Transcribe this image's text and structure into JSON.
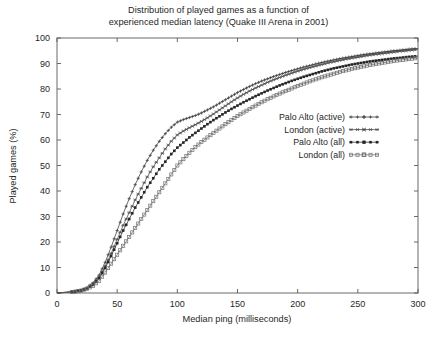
{
  "chart_data": {
    "type": "line",
    "title": "Distribution of played games as a function of experienced median latency (Quake III Arena in 2001)",
    "title_line1": "Distribution of played games as a function of",
    "title_line2": "experienced median latency (Quake III Arena in 2001)",
    "xlabel": "Median ping (milliseconds)",
    "ylabel": "Played games (%)",
    "xlim": [
      0,
      300
    ],
    "ylim": [
      0,
      100
    ],
    "xticks": [
      0,
      50,
      100,
      150,
      200,
      250,
      300
    ],
    "yticks": [
      0,
      10,
      20,
      30,
      40,
      50,
      60,
      70,
      80,
      90,
      100
    ],
    "xtick_labels": [
      "0",
      "50",
      "100",
      "150",
      "200",
      "250",
      "300"
    ],
    "ytick_labels": [
      "0",
      "10",
      "20",
      "30",
      "40",
      "50",
      "60",
      "70",
      "80",
      "90",
      "100"
    ],
    "grid": false,
    "legend_position": "center-right",
    "legend_entries": [
      {
        "label": "Palo Alto (active)",
        "marker": "plus-marker",
        "color": "#3b3b3b"
      },
      {
        "label": "London (active)",
        "marker": "cross-marker",
        "color": "#4a4a4a"
      },
      {
        "label": "Palo Alto (all)",
        "marker": "filled-square-marker",
        "color": "#262626"
      },
      {
        "label": "London (all)",
        "marker": "open-square-marker",
        "color": "#6e6e6e"
      }
    ],
    "x": [
      0,
      5,
      10,
      15,
      20,
      25,
      30,
      35,
      40,
      45,
      50,
      55,
      60,
      65,
      70,
      75,
      80,
      85,
      90,
      95,
      100,
      105,
      110,
      115,
      120,
      125,
      130,
      135,
      140,
      145,
      150,
      155,
      160,
      165,
      170,
      175,
      180,
      185,
      190,
      195,
      200,
      205,
      210,
      215,
      220,
      225,
      230,
      235,
      240,
      245,
      250,
      255,
      260,
      265,
      270,
      275,
      280,
      285,
      290,
      295,
      300
    ],
    "series": [
      {
        "name": "Palo Alto (active)",
        "marker": "plus-marker",
        "color": "#3b3b3b",
        "values": [
          0,
          0.2,
          0.4,
          0.7,
          1.2,
          2.2,
          4.0,
          7.0,
          12.0,
          18.0,
          24.5,
          31.0,
          37.0,
          42.5,
          47.5,
          52.0,
          56.0,
          59.5,
          62.5,
          65.0,
          67.0,
          68.0,
          68.8,
          69.6,
          70.6,
          71.8,
          73.0,
          74.4,
          75.8,
          77.2,
          78.6,
          79.8,
          81.0,
          82.1,
          83.1,
          84.0,
          84.9,
          85.7,
          86.5,
          87.2,
          87.9,
          88.6,
          89.2,
          89.8,
          90.4,
          90.9,
          91.4,
          91.9,
          92.3,
          92.7,
          93.1,
          93.5,
          93.8,
          94.1,
          94.4,
          94.7,
          95.0,
          95.2,
          95.5,
          95.7,
          95.9
        ]
      },
      {
        "name": "London (active)",
        "marker": "cross-marker",
        "color": "#4a4a4a",
        "values": [
          0,
          0.2,
          0.4,
          0.6,
          1.0,
          1.9,
          3.5,
          6.2,
          10.5,
          15.5,
          21.0,
          26.5,
          31.5,
          36.5,
          41.0,
          45.5,
          49.5,
          53.0,
          56.5,
          59.5,
          62.0,
          63.5,
          64.8,
          66.0,
          67.3,
          68.7,
          70.2,
          71.8,
          73.4,
          75.0,
          76.5,
          77.9,
          79.2,
          80.4,
          81.5,
          82.6,
          83.6,
          84.5,
          85.4,
          86.2,
          87.0,
          87.7,
          88.4,
          89.0,
          89.6,
          90.2,
          90.7,
          91.2,
          91.7,
          92.1,
          92.5,
          92.9,
          93.3,
          93.6,
          93.9,
          94.2,
          94.5,
          94.8,
          95.0,
          95.3,
          95.5
        ]
      },
      {
        "name": "Palo Alto (all)",
        "marker": "filled-square-marker",
        "color": "#262626",
        "values": [
          0,
          0.2,
          0.3,
          0.6,
          1.0,
          1.8,
          3.2,
          5.8,
          9.8,
          14.5,
          19.5,
          24.5,
          29.0,
          33.5,
          37.5,
          41.5,
          45.0,
          48.5,
          51.5,
          54.5,
          57.0,
          59.0,
          61.0,
          62.8,
          64.5,
          66.2,
          67.8,
          69.3,
          70.8,
          72.2,
          73.5,
          74.8,
          76.0,
          77.2,
          78.3,
          79.4,
          80.4,
          81.4,
          82.3,
          83.2,
          84.0,
          84.8,
          85.5,
          86.2,
          86.9,
          87.5,
          88.1,
          88.6,
          89.1,
          89.6,
          90.0,
          90.4,
          90.8,
          91.1,
          91.4,
          91.7,
          92.0,
          92.2,
          92.5,
          92.7,
          92.9
        ]
      },
      {
        "name": "London (all)",
        "marker": "open-square-marker",
        "color": "#6e6e6e",
        "values": [
          0,
          0.1,
          0.3,
          0.5,
          0.9,
          1.6,
          2.8,
          4.8,
          8.0,
          11.5,
          15.0,
          18.5,
          22.0,
          25.5,
          29.0,
          32.5,
          36.0,
          39.5,
          43.0,
          46.5,
          50.0,
          52.5,
          55.0,
          57.2,
          59.2,
          61.0,
          62.8,
          64.5,
          66.2,
          67.8,
          69.4,
          70.8,
          72.2,
          73.5,
          74.8,
          76.0,
          77.1,
          78.2,
          79.2,
          80.2,
          81.2,
          82.1,
          83.0,
          83.8,
          84.6,
          85.3,
          86.0,
          86.7,
          87.3,
          87.9,
          88.4,
          88.9,
          89.4,
          89.8,
          90.2,
          90.6,
          91.0,
          91.3,
          91.6,
          91.9,
          92.2
        ]
      }
    ]
  }
}
